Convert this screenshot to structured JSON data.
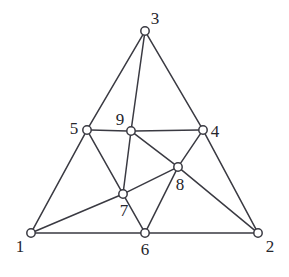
{
  "figure": {
    "width": 289,
    "height": 277,
    "background_color": "#ffffff",
    "line_color": "#3a3a42",
    "node_fill_color": "#ffffff",
    "label_color": "#26262c"
  },
  "graph_data": {
    "type": "node-link-diagram",
    "description": "Undirected planar graph drawn as a triangle with interior vertices",
    "node_count": 9,
    "edge_count": 17,
    "nodes": [
      {
        "id": "1",
        "label": "1",
        "x": 31,
        "y": 233,
        "label_x": 20,
        "label_y": 246
      },
      {
        "id": "2",
        "label": "2",
        "x": 258,
        "y": 233,
        "label_x": 270,
        "label_y": 246
      },
      {
        "id": "3",
        "label": "3",
        "x": 145,
        "y": 31,
        "label_x": 155,
        "label_y": 18
      },
      {
        "id": "4",
        "label": "4",
        "x": 203,
        "y": 130,
        "label_x": 215,
        "label_y": 131
      },
      {
        "id": "5",
        "label": "5",
        "x": 87,
        "y": 130,
        "label_x": 74,
        "label_y": 128
      },
      {
        "id": "6",
        "label": "6",
        "x": 145,
        "y": 233,
        "label_x": 145,
        "label_y": 249
      },
      {
        "id": "7",
        "label": "7",
        "x": 123,
        "y": 194,
        "label_x": 124,
        "label_y": 210
      },
      {
        "id": "8",
        "label": "8",
        "x": 178,
        "y": 167,
        "label_x": 180,
        "label_y": 184
      },
      {
        "id": "9",
        "label": "9",
        "x": 131,
        "y": 131,
        "label_x": 120,
        "label_y": 119
      }
    ],
    "edges": [
      {
        "source": "1",
        "target": "6"
      },
      {
        "source": "6",
        "target": "2"
      },
      {
        "source": "1",
        "target": "5"
      },
      {
        "source": "5",
        "target": "3"
      },
      {
        "source": "3",
        "target": "4"
      },
      {
        "source": "4",
        "target": "2"
      },
      {
        "source": "5",
        "target": "9"
      },
      {
        "source": "9",
        "target": "4"
      },
      {
        "source": "3",
        "target": "9"
      },
      {
        "source": "5",
        "target": "7"
      },
      {
        "source": "9",
        "target": "7"
      },
      {
        "source": "9",
        "target": "8"
      },
      {
        "source": "7",
        "target": "8"
      },
      {
        "source": "4",
        "target": "8"
      },
      {
        "source": "1",
        "target": "7"
      },
      {
        "source": "7",
        "target": "6"
      },
      {
        "source": "6",
        "target": "8"
      },
      {
        "source": "8",
        "target": "2"
      }
    ],
    "node_radius": 4.2
  }
}
